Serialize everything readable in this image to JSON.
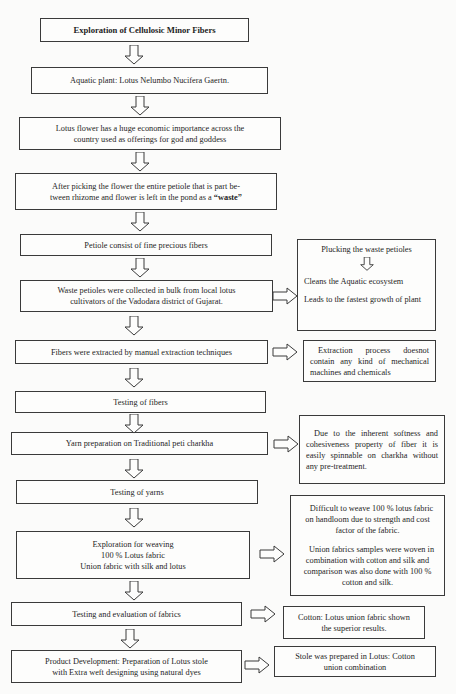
{
  "diagram": {
    "title": "Exploration of Cellulosic Minor Fibers",
    "main_flow": [
      {
        "lines": [
          "Aquatic plant: Lotus Nelumbo Nucifera Gaertn."
        ]
      },
      {
        "lines": [
          "Lotus flower has a huge economic importance across the",
          "country used as offerings for god and goddess"
        ]
      },
      {
        "lines": [
          "After picking the flower the entire petiole that is part be-",
          "tween rhizome and flower is left in the pond as a "
        ],
        "emphasis": "“waste”"
      },
      {
        "lines": [
          "Petiole consist of fine precious fibers"
        ]
      },
      {
        "lines": [
          "Waste petioles were collected in bulk from local lotus",
          "cultivators of the Vadodara district of Gujarat."
        ]
      },
      {
        "lines": [
          "Fibers were extracted by manual extraction techniques"
        ]
      },
      {
        "lines": [
          "Testing of fibers"
        ]
      },
      {
        "lines": [
          "Yarn preparation on Traditional peti charkha"
        ]
      },
      {
        "lines": [
          "Testing of yarns"
        ]
      },
      {
        "lines": [
          "Exploration for weaving",
          "100 % Lotus fabric",
          "Union fabric with silk and lotus"
        ]
      },
      {
        "lines": [
          "Testing and evaluation of fabrics"
        ]
      },
      {
        "lines": [
          "Product Development: Preparation of Lotus stole",
          "with Extra weft designing using natural dyes"
        ]
      }
    ],
    "side_notes": [
      {
        "attached_to": "Waste petioles were collected in bulk from local lotus cultivators of the Vadodara district of Gujarat.",
        "items": [
          "Plucking the waste petioles",
          "Cleans the Aquatic ecosystem",
          "Leads to the fastest growth of plant"
        ]
      },
      {
        "attached_to": "Fibers were extracted by manual extraction techniques",
        "items": [
          "Extraction process doesnot contain any kind of mechanical machines and chemicals"
        ]
      },
      {
        "attached_to": "Yarn preparation on Traditional peti charkha",
        "items": [
          "Due to the inherent softness and cohesiveness property of fiber it is easily spinnable on charkha without any pre-treatment."
        ]
      },
      {
        "attached_to": "Exploration for weaving",
        "items": [
          "Difficult to weave 100 % lotus fabric on handloom due to strength and cost factor of the fabric.",
          "Union fabrics samples were woven in combination with cotton and silk and comparison was also done with 100 % cotton and silk."
        ]
      },
      {
        "attached_to": "Testing and evaluation of fabrics",
        "items": [
          "Cotton: Lotus union fabric shown the superior results."
        ]
      },
      {
        "attached_to": "Product Development",
        "items": [
          "Stole was prepared in Lotus: Cotton union combination"
        ]
      }
    ],
    "colors": {
      "border": "#3a3a3a",
      "text": "#1e1e1e",
      "background": "#fbfbfa"
    }
  }
}
